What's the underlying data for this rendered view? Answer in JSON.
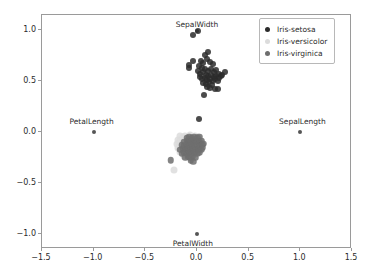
{
  "chart_data": {
    "type": "scatter",
    "title": "",
    "xlabel": "",
    "ylabel": "",
    "xlim": [
      -1.5,
      1.5
    ],
    "ylim": [
      -1.15,
      1.15
    ],
    "grid": false,
    "legend_position": "upper right",
    "xticks": [
      "-1.5",
      "-1.0",
      "-0.5",
      "0.0",
      "0.5",
      "1.0",
      "1.5"
    ],
    "xtick_values": [
      -1.5,
      -1.0,
      -0.5,
      0.0,
      0.5,
      1.0,
      1.5
    ],
    "yticks": [
      "1.0",
      "0.5",
      "0.0",
      "-0.5",
      "-1.0"
    ],
    "ytick_values": [
      1.0,
      0.5,
      0.0,
      -0.5,
      -1.0
    ],
    "legend": [
      {
        "name": "Iris-setosa",
        "color": "#2b2b2b"
      },
      {
        "name": "Iris-versicolor",
        "color": "#dcdcdc"
      },
      {
        "name": "Iris-virginica",
        "color": "#6e6e6e"
      }
    ],
    "annotations": [
      {
        "label": "SepalWidth",
        "x": 0.0,
        "y": 1.06,
        "marker_x": 0.0,
        "marker_y": 0.99
      },
      {
        "label": "PetalLength",
        "x": -1.02,
        "y": 0.11,
        "marker_x": -1.0,
        "marker_y": 0.0
      },
      {
        "label": "SepalLength",
        "x": 1.02,
        "y": 0.11,
        "marker_x": 1.0,
        "marker_y": 0.0
      },
      {
        "label": "PetalWidth",
        "x": -0.04,
        "y": -1.09,
        "marker_x": 0.0,
        "marker_y": -1.0
      }
    ],
    "series": [
      {
        "name": "Iris-setosa",
        "color": "#2b2b2b",
        "marker_size": 6,
        "opacity": 0.85,
        "points": [
          [
            -0.035,
            0.955
          ],
          [
            0.005,
            0.99
          ],
          [
            0.105,
            0.79
          ],
          [
            0.075,
            0.755
          ],
          [
            -0.075,
            0.655
          ],
          [
            -0.08,
            0.63
          ],
          [
            -0.04,
            0.695
          ],
          [
            0.035,
            0.7
          ],
          [
            0.06,
            0.675
          ],
          [
            0.095,
            0.715
          ],
          [
            0.13,
            0.69
          ],
          [
            0.155,
            0.665
          ],
          [
            0.02,
            0.645
          ],
          [
            0.05,
            0.625
          ],
          [
            0.08,
            0.62
          ],
          [
            0.105,
            0.6
          ],
          [
            0.135,
            0.615
          ],
          [
            0.16,
            0.59
          ],
          [
            0.185,
            0.605
          ],
          [
            0.215,
            0.575
          ],
          [
            0.24,
            0.565
          ],
          [
            0.27,
            0.585
          ],
          [
            0.005,
            0.6
          ],
          [
            0.03,
            0.575
          ],
          [
            0.055,
            0.585
          ],
          [
            0.085,
            0.565
          ],
          [
            0.11,
            0.555
          ],
          [
            0.135,
            0.565
          ],
          [
            0.16,
            0.545
          ],
          [
            0.185,
            0.555
          ],
          [
            0.21,
            0.535
          ],
          [
            0.235,
            0.555
          ],
          [
            0.025,
            0.545
          ],
          [
            0.05,
            0.525
          ],
          [
            0.075,
            0.535
          ],
          [
            0.1,
            0.515
          ],
          [
            0.125,
            0.525
          ],
          [
            0.15,
            0.505
          ],
          [
            0.175,
            0.52
          ],
          [
            0.2,
            0.5
          ],
          [
            0.06,
            0.485
          ],
          [
            0.09,
            0.475
          ],
          [
            0.115,
            0.49
          ],
          [
            0.145,
            0.465
          ],
          [
            0.095,
            0.445
          ],
          [
            0.125,
            0.43
          ],
          [
            0.07,
            0.365
          ],
          [
            0.175,
            0.42
          ],
          [
            0.2,
            0.425
          ],
          [
            0.015,
            0.125
          ]
        ]
      },
      {
        "name": "Iris-versicolor",
        "color": "#dcdcdc",
        "marker_size": 7,
        "opacity": 0.85,
        "points": [
          [
            -0.165,
            -0.035
          ],
          [
            -0.14,
            -0.05
          ],
          [
            -0.115,
            -0.035
          ],
          [
            -0.09,
            -0.045
          ],
          [
            -0.065,
            -0.03
          ],
          [
            -0.04,
            -0.045
          ],
          [
            -0.015,
            -0.035
          ],
          [
            0.01,
            -0.05
          ],
          [
            -0.185,
            -0.075
          ],
          [
            -0.16,
            -0.085
          ],
          [
            -0.135,
            -0.07
          ],
          [
            -0.11,
            -0.085
          ],
          [
            -0.085,
            -0.075
          ],
          [
            -0.06,
            -0.09
          ],
          [
            -0.035,
            -0.075
          ],
          [
            -0.01,
            -0.085
          ],
          [
            0.015,
            -0.075
          ],
          [
            0.035,
            -0.09
          ],
          [
            -0.195,
            -0.12
          ],
          [
            -0.17,
            -0.115
          ],
          [
            -0.145,
            -0.125
          ],
          [
            -0.12,
            -0.115
          ],
          [
            -0.095,
            -0.125
          ],
          [
            -0.07,
            -0.115
          ],
          [
            -0.045,
            -0.125
          ],
          [
            -0.02,
            -0.115
          ],
          [
            0.005,
            -0.125
          ],
          [
            0.03,
            -0.115
          ],
          [
            -0.185,
            -0.16
          ],
          [
            -0.16,
            -0.155
          ],
          [
            -0.135,
            -0.165
          ],
          [
            -0.11,
            -0.155
          ],
          [
            -0.085,
            -0.165
          ],
          [
            -0.06,
            -0.155
          ],
          [
            -0.035,
            -0.165
          ],
          [
            -0.01,
            -0.155
          ],
          [
            0.015,
            -0.165
          ],
          [
            0.04,
            -0.15
          ],
          [
            -0.165,
            -0.2
          ],
          [
            -0.14,
            -0.195
          ],
          [
            -0.115,
            -0.205
          ],
          [
            -0.09,
            -0.195
          ],
          [
            -0.065,
            -0.205
          ],
          [
            -0.04,
            -0.195
          ],
          [
            -0.015,
            -0.205
          ],
          [
            0.01,
            -0.195
          ],
          [
            -0.125,
            -0.235
          ],
          [
            -0.1,
            -0.245
          ],
          [
            -0.075,
            -0.235
          ],
          [
            -0.225,
            -0.375
          ]
        ]
      },
      {
        "name": "Iris-virginica",
        "color": "#6e6e6e",
        "marker_size": 6.5,
        "opacity": 0.85,
        "points": [
          [
            -0.1,
            -0.055
          ],
          [
            -0.075,
            -0.045
          ],
          [
            -0.05,
            -0.06
          ],
          [
            -0.025,
            -0.05
          ],
          [
            0.0,
            -0.06
          ],
          [
            0.02,
            -0.045
          ],
          [
            -0.125,
            -0.095
          ],
          [
            -0.1,
            -0.085
          ],
          [
            -0.075,
            -0.1
          ],
          [
            -0.05,
            -0.09
          ],
          [
            -0.025,
            -0.1
          ],
          [
            0.0,
            -0.09
          ],
          [
            0.025,
            -0.1
          ],
          [
            0.045,
            -0.085
          ],
          [
            -0.15,
            -0.13
          ],
          [
            -0.125,
            -0.14
          ],
          [
            -0.1,
            -0.13
          ],
          [
            -0.075,
            -0.14
          ],
          [
            -0.05,
            -0.13
          ],
          [
            -0.025,
            -0.14
          ],
          [
            0.0,
            -0.13
          ],
          [
            0.025,
            -0.14
          ],
          [
            0.05,
            -0.125
          ],
          [
            -0.16,
            -0.175
          ],
          [
            -0.135,
            -0.165
          ],
          [
            -0.11,
            -0.175
          ],
          [
            -0.085,
            -0.165
          ],
          [
            -0.06,
            -0.18
          ],
          [
            -0.035,
            -0.17
          ],
          [
            -0.01,
            -0.18
          ],
          [
            0.015,
            -0.17
          ],
          [
            0.04,
            -0.175
          ],
          [
            -0.15,
            -0.215
          ],
          [
            -0.125,
            -0.205
          ],
          [
            -0.1,
            -0.215
          ],
          [
            -0.075,
            -0.205
          ],
          [
            -0.05,
            -0.215
          ],
          [
            -0.025,
            -0.205
          ],
          [
            0.0,
            -0.215
          ],
          [
            0.02,
            -0.2
          ],
          [
            -0.115,
            -0.25
          ],
          [
            -0.09,
            -0.245
          ],
          [
            -0.065,
            -0.255
          ],
          [
            -0.04,
            -0.245
          ],
          [
            -0.015,
            -0.255
          ],
          [
            -0.06,
            -0.285
          ],
          [
            -0.035,
            -0.29
          ],
          [
            -0.255,
            -0.28
          ],
          [
            0.055,
            -0.155
          ],
          [
            0.06,
            -0.115
          ]
        ]
      }
    ]
  }
}
